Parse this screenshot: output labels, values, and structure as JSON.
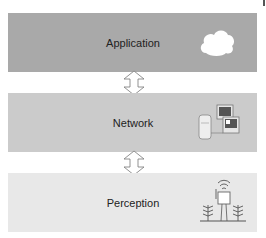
{
  "diagram": {
    "layers": [
      {
        "label": "Application",
        "icon": "cloud-icon",
        "color": "#a9a9a9"
      },
      {
        "label": "Network",
        "icon": "computers-icon",
        "color": "#cbcbcb"
      },
      {
        "label": "Perception",
        "icon": "sensor-field-icon",
        "color": "#e8e8e8"
      }
    ],
    "arrows": [
      {
        "between": [
          "Application",
          "Network"
        ],
        "type": "bidirectional"
      },
      {
        "between": [
          "Network",
          "Perception"
        ],
        "type": "bidirectional"
      }
    ]
  }
}
